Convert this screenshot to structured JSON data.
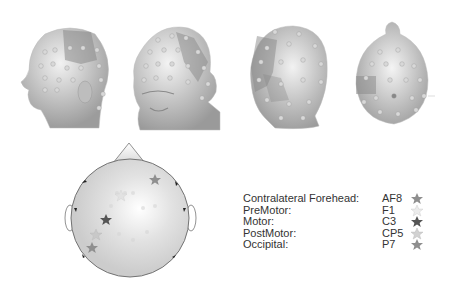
{
  "figure": {
    "views": [
      {
        "id": "left-lateral",
        "label": "Left lateral view of head with electrode cap"
      },
      {
        "id": "front-oblique",
        "label": "Frontal oblique view of head with electrode cap"
      },
      {
        "id": "back-oblique",
        "label": "Posterior oblique view of head with electrode cap"
      },
      {
        "id": "top",
        "label": "Top view of head with electrode cap"
      }
    ],
    "topomap": {
      "nose": "up",
      "stars": [
        {
          "electrode": "AF8",
          "color": "#8f8f8f"
        },
        {
          "electrode": "F1",
          "color": "#e2e2e2"
        },
        {
          "electrode": "C3",
          "color": "#555555"
        },
        {
          "electrode": "CP5",
          "color": "#c8c8c8"
        },
        {
          "electrode": "P7",
          "color": "#8f8f8f"
        }
      ]
    },
    "legend": [
      {
        "region": "Contralateral Forehead:",
        "electrode": "AF8",
        "star_color": "#8f8f8f"
      },
      {
        "region": "PreMotor:",
        "electrode": "F1",
        "star_color": "#e6e6e6"
      },
      {
        "region": "Motor:",
        "electrode": "C3",
        "star_color": "#555555"
      },
      {
        "region": "PostMotor:",
        "electrode": "CP5",
        "star_color": "#cfcfcf"
      },
      {
        "region": "Occipital:",
        "electrode": "P7",
        "star_color": "#8f8f8f"
      }
    ]
  }
}
